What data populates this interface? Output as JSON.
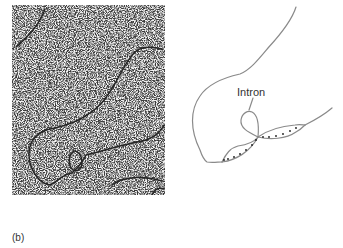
{
  "figure": {
    "panel_label": "(b)",
    "micrograph": {
      "description": "electron micrograph of DNA-RNA hybrid showing looped-out intron",
      "background_color": "#f2f2f2",
      "strand_color": "#2a2a2a"
    },
    "diagram": {
      "annotation": "Intron",
      "line_color": "#808080",
      "dot_color": "#1a1a1a"
    }
  }
}
